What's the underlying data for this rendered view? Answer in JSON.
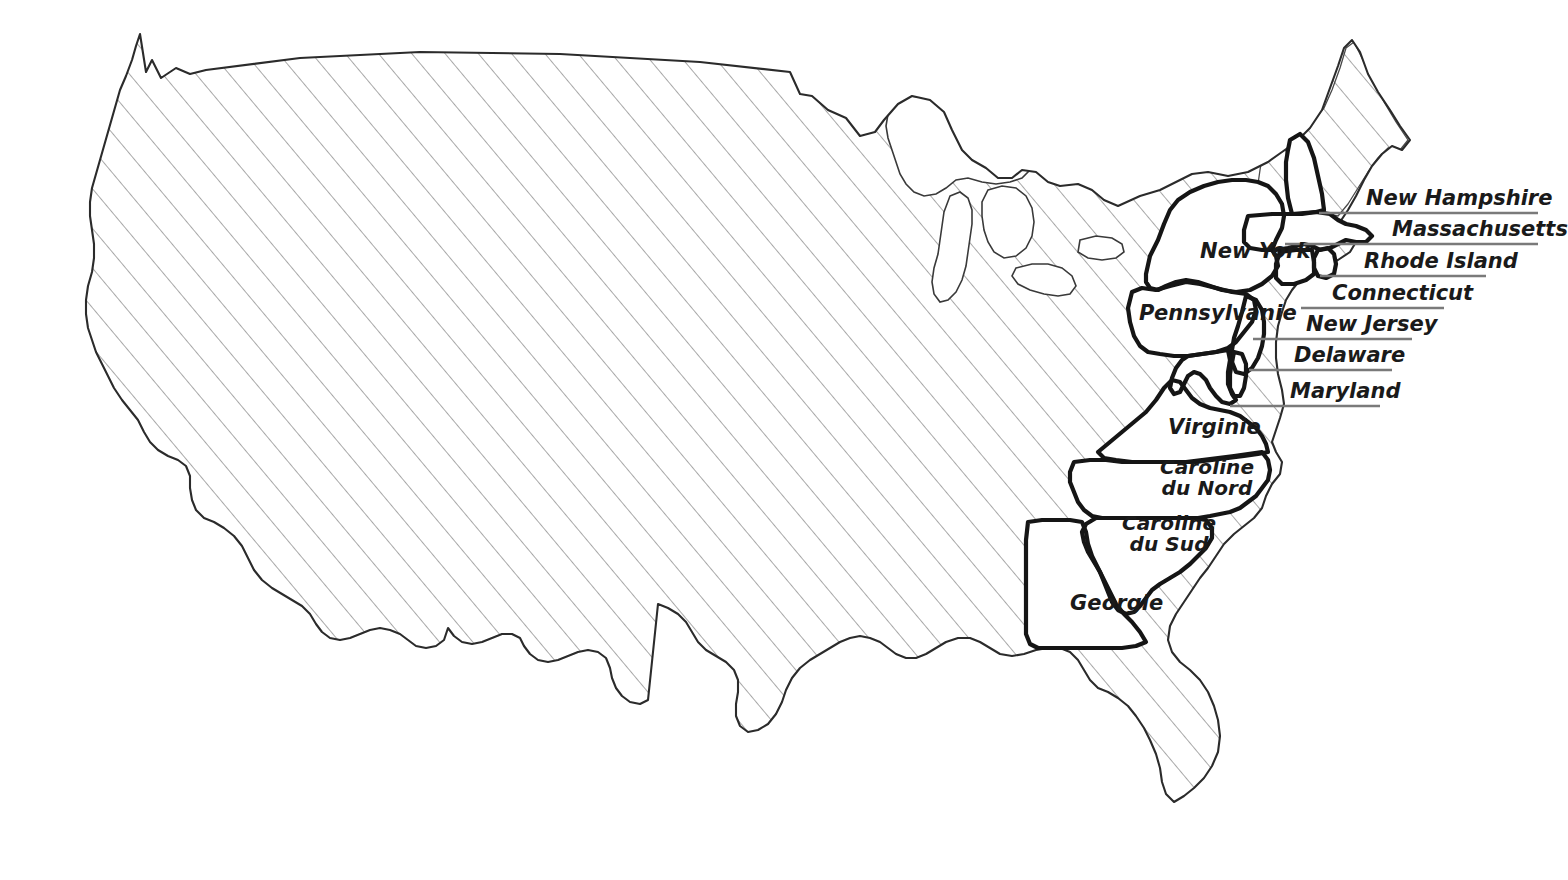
{
  "map": {
    "title": "Carte des Treize Colonies des États-Unis",
    "background_color": "#ffffff",
    "hatch_color": "#8c8c8c",
    "outline_color": "#2b2b2b",
    "colony_border_color": "#151515",
    "label_color": "#1a1a1a",
    "leader_line_color": "#7a7a7a"
  },
  "inner_labels": [
    {
      "name": "new-york",
      "text": "New York",
      "x": 1200,
      "y": 240,
      "size": 21
    },
    {
      "name": "pennsylvanie",
      "text": "Pennsylvanie",
      "x": 1139,
      "y": 302,
      "size": 21
    },
    {
      "name": "virginie",
      "text": "Virginie",
      "x": 1168,
      "y": 416,
      "size": 21
    },
    {
      "name": "caroline-du-nord",
      "line1": "Caroline",
      "line2": "du Nord",
      "x": 1160,
      "y": 457,
      "size": 20
    },
    {
      "name": "caroline-du-sud",
      "line1": "Caroline",
      "line2": "du Sud",
      "x": 1122,
      "y": 513,
      "size": 20
    },
    {
      "name": "georgie",
      "text": "Georgie",
      "x": 1070,
      "y": 592,
      "size": 21
    }
  ],
  "callouts": [
    {
      "name": "new-hampshire",
      "text": "New Hampshire",
      "label_x": 1366,
      "label_y": 188,
      "size": 21,
      "leader": {
        "x1": 1319,
        "y1": 213,
        "x2": 1538,
        "y2": 213
      }
    },
    {
      "name": "massachusetts",
      "text": "Massachusetts",
      "label_x": 1392,
      "label_y": 219,
      "size": 21,
      "leader": {
        "x1": 1285,
        "y1": 244,
        "x2": 1538,
        "y2": 244
      }
    },
    {
      "name": "rhode-island",
      "text": "Rhode Island",
      "label_x": 1364,
      "label_y": 251,
      "size": 21,
      "leader": {
        "x1": 1320,
        "y1": 276,
        "x2": 1486,
        "y2": 276
      }
    },
    {
      "name": "connecticut",
      "text": "Connecticut",
      "label_x": 1332,
      "label_y": 283,
      "size": 21,
      "leader": {
        "x1": 1301,
        "y1": 308,
        "x2": 1444,
        "y2": 308
      }
    },
    {
      "name": "new-jersey",
      "text": "New Jersey",
      "label_x": 1306,
      "label_y": 314,
      "size": 21,
      "leader": {
        "x1": 1253,
        "y1": 339,
        "x2": 1412,
        "y2": 339
      }
    },
    {
      "name": "delaware",
      "text": "Delaware",
      "label_x": 1294,
      "label_y": 345,
      "size": 21,
      "leader": {
        "x1": 1249,
        "y1": 370,
        "x2": 1392,
        "y2": 370
      }
    },
    {
      "name": "maryland",
      "text": "Maryland",
      "label_x": 1290,
      "label_y": 381,
      "size": 21,
      "leader": {
        "x1": 1230,
        "y1": 406,
        "x2": 1380,
        "y2": 406
      }
    }
  ],
  "legend_note": {
    "colonies_style": "white fill, thick black outline",
    "other_states_style": "diagonal hatch fill, thin outline"
  }
}
